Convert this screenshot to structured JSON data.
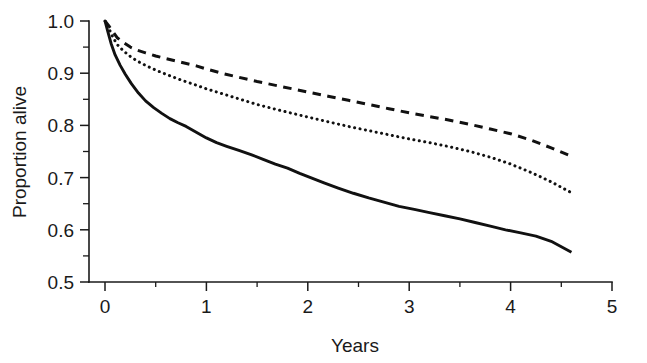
{
  "chart_data": {
    "type": "line",
    "title": "",
    "subtitle": "",
    "xlabel": "Years",
    "ylabel": "Proportion alive",
    "xlim": [
      0,
      5
    ],
    "ylim": [
      0.5,
      1.0
    ],
    "grid": false,
    "legend": "none",
    "x_ticks": [
      0,
      1,
      2,
      3,
      4,
      5
    ],
    "x_tick_labels": [
      "0",
      "1",
      "2",
      "3",
      "4",
      "5"
    ],
    "x_minor_ticks": [
      0.5,
      1.5,
      2.5,
      3.5,
      4.5
    ],
    "y_ticks": [
      0.5,
      0.6,
      0.7,
      0.8,
      0.9,
      1.0
    ],
    "y_tick_labels": [
      "0.5",
      "0.6",
      "0.7",
      "0.8",
      "0.9",
      "1.0"
    ],
    "y_minor_ticks": [
      0.55,
      0.65,
      0.75,
      0.85,
      0.95
    ],
    "series": [
      {
        "name": "dashed-upper-curve",
        "style": "dashed",
        "color": "#111111",
        "x": [
          0.0,
          0.04,
          0.08,
          0.12,
          0.18,
          0.25,
          0.32,
          0.4,
          0.5,
          0.6,
          0.75,
          0.9,
          1.0,
          1.15,
          1.3,
          1.5,
          1.7,
          1.85,
          2.0,
          2.2,
          2.4,
          2.6,
          2.8,
          3.0,
          3.2,
          3.4,
          3.6,
          3.8,
          4.0,
          4.2,
          4.4,
          4.6
        ],
        "y": [
          1.0,
          0.99,
          0.979,
          0.968,
          0.959,
          0.95,
          0.944,
          0.939,
          0.933,
          0.928,
          0.921,
          0.914,
          0.908,
          0.9,
          0.893,
          0.884,
          0.876,
          0.87,
          0.864,
          0.856,
          0.848,
          0.84,
          0.832,
          0.824,
          0.817,
          0.81,
          0.802,
          0.793,
          0.784,
          0.772,
          0.757,
          0.741
        ]
      },
      {
        "name": "dotted-middle-curve",
        "style": "dotted",
        "color": "#111111",
        "x": [
          0.0,
          0.04,
          0.08,
          0.12,
          0.18,
          0.25,
          0.32,
          0.4,
          0.5,
          0.6,
          0.75,
          0.9,
          1.0,
          1.15,
          1.3,
          1.5,
          1.7,
          1.85,
          2.0,
          2.2,
          2.4,
          2.6,
          2.8,
          3.0,
          3.2,
          3.4,
          3.6,
          3.8,
          4.0,
          4.2,
          4.4,
          4.6
        ],
        "y": [
          1.0,
          0.985,
          0.968,
          0.955,
          0.943,
          0.932,
          0.923,
          0.915,
          0.906,
          0.898,
          0.887,
          0.877,
          0.87,
          0.861,
          0.852,
          0.84,
          0.83,
          0.823,
          0.816,
          0.807,
          0.798,
          0.79,
          0.782,
          0.774,
          0.767,
          0.759,
          0.75,
          0.739,
          0.726,
          0.71,
          0.692,
          0.671
        ]
      },
      {
        "name": "solid-lower-curve",
        "style": "solid",
        "color": "#111111",
        "x": [
          0.0,
          0.03,
          0.06,
          0.1,
          0.15,
          0.2,
          0.26,
          0.33,
          0.4,
          0.48,
          0.56,
          0.64,
          0.72,
          0.8,
          0.9,
          1.0,
          1.1,
          1.2,
          1.32,
          1.44,
          1.56,
          1.68,
          1.8,
          1.92,
          2.04,
          2.16,
          2.3,
          2.45,
          2.6,
          2.75,
          2.9,
          3.05,
          3.2,
          3.35,
          3.5,
          3.65,
          3.8,
          3.95,
          4.1,
          4.25,
          4.4,
          4.6
        ],
        "y": [
          1.0,
          0.978,
          0.957,
          0.935,
          0.915,
          0.898,
          0.88,
          0.862,
          0.847,
          0.834,
          0.823,
          0.813,
          0.805,
          0.798,
          0.787,
          0.776,
          0.767,
          0.76,
          0.752,
          0.744,
          0.735,
          0.726,
          0.718,
          0.708,
          0.699,
          0.69,
          0.68,
          0.67,
          0.661,
          0.653,
          0.645,
          0.639,
          0.633,
          0.627,
          0.621,
          0.614,
          0.607,
          0.6,
          0.594,
          0.588,
          0.578,
          0.557
        ]
      }
    ]
  }
}
